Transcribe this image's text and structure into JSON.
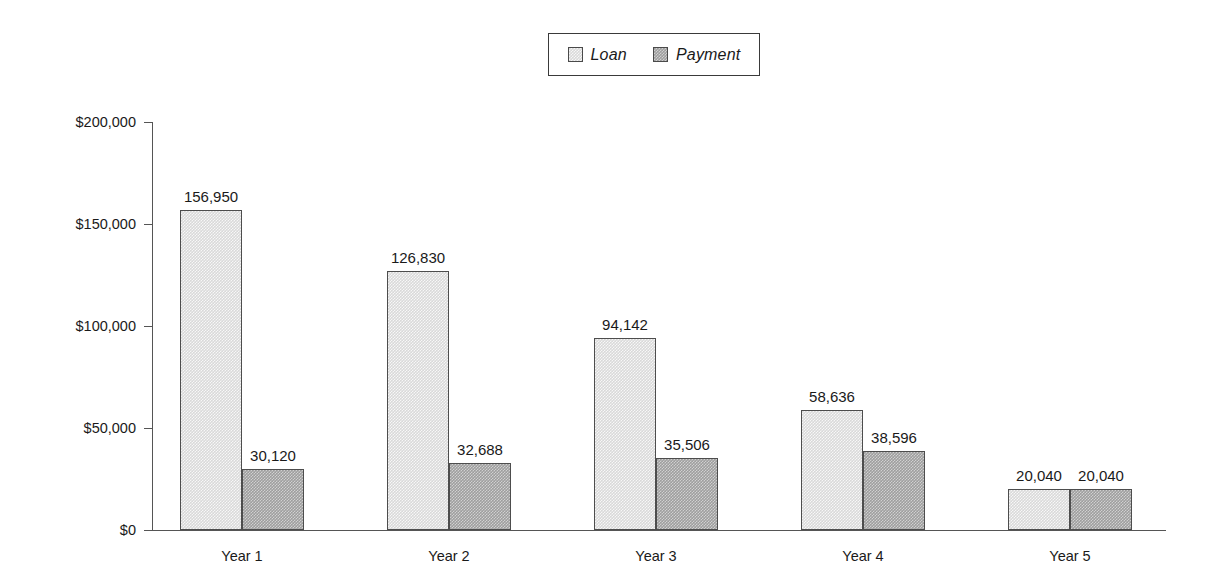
{
  "legend": {
    "entries": [
      {
        "label": "Loan",
        "color": "#d9d9d9",
        "icon": "legend-swatch-icon"
      },
      {
        "label": "Payment",
        "color": "#9e9e9e",
        "icon": "legend-swatch-icon"
      }
    ]
  },
  "axis": {
    "y_ticks": [
      "$0",
      "$50,000",
      "$100,000",
      "$150,000",
      "$200,000"
    ],
    "x_labels": [
      "Year 1",
      "Year 2",
      "Year 3",
      "Year 4",
      "Year 5"
    ]
  },
  "chart_data": {
    "type": "bar",
    "title": "",
    "subtitle": "",
    "xlabel": "",
    "ylabel": "",
    "categories": [
      "Year 1",
      "Year 2",
      "Year 3",
      "Year 4",
      "Year 5"
    ],
    "series": [
      {
        "name": "Loan",
        "color": "#d9d9d9",
        "values": [
          156950,
          126830,
          94142,
          58636,
          20040
        ],
        "labels": [
          "156,950",
          "126,830",
          "94,142",
          "58,636",
          "20,040"
        ]
      },
      {
        "name": "Payment",
        "color": "#9e9e9e",
        "values": [
          30120,
          32688,
          35506,
          38596,
          20040
        ],
        "labels": [
          "30,120",
          "32,688",
          "35,506",
          "38,596",
          "20,040"
        ]
      }
    ],
    "ylim": [
      0,
      200000
    ],
    "ytick_values": [
      0,
      50000,
      100000,
      150000,
      200000
    ],
    "ytick_labels": [
      "$0",
      "$50,000",
      "$100,000",
      "$150,000",
      "$200,000"
    ],
    "grid": false,
    "legend_position": "top-center",
    "value_labels_shown": true,
    "bars_adjacent_within_group": true
  }
}
